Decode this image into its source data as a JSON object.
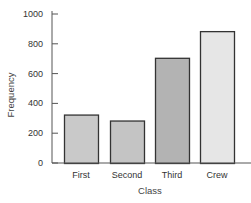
{
  "chart_data": {
    "type": "bar",
    "title": "",
    "xlabel": "Class",
    "ylabel": "Frequency",
    "categories": [
      "First",
      "Second",
      "Third",
      "Crew"
    ],
    "values": [
      325,
      285,
      706,
      885
    ],
    "ylim": [
      0,
      1000
    ],
    "yticks": [
      0,
      200,
      400,
      600,
      800,
      1000
    ],
    "grid": false,
    "legend": null,
    "colors": [
      "#c9c9c9",
      "#c4c4c4",
      "#b3b3b3",
      "#e6e6e6"
    ]
  }
}
